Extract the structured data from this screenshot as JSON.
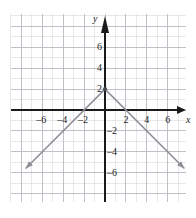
{
  "figure": {
    "background_color": "#ffffff",
    "plot_background_color": "#ffffff"
  },
  "chart_data": {
    "type": "line",
    "title": "",
    "xlabel": "x",
    "ylabel": "y",
    "xlim": [
      -8,
      8
    ],
    "ylim": [
      -7,
      7
    ],
    "grid": true,
    "grid_minor_spacing": 1,
    "grid_major_spacing": 2,
    "legend": "none",
    "equation": "y = -|x| + 2",
    "vertex": {
      "x": 0,
      "y": 2,
      "marker": "dot"
    },
    "xticks": [
      -6,
      -4,
      -2,
      2,
      4,
      6
    ],
    "xtick_labels": [
      "–6",
      "–4",
      "–2",
      "2",
      "4",
      "6"
    ],
    "yticks": [
      -6,
      -4,
      -2,
      2,
      4,
      6
    ],
    "ytick_labels": [
      "–6",
      "–4",
      "–2",
      "2",
      "4",
      "6"
    ],
    "series": [
      {
        "name": "y = -|x| + 2",
        "color": "#8d8d96",
        "arrow_start": true,
        "arrow_end": true,
        "x": [
          -7.6,
          0,
          7.6
        ],
        "y": [
          -5.6,
          2,
          -5.6
        ]
      }
    ],
    "colors": {
      "curve": "#8d8d96",
      "axis": "#1a1a1a",
      "grid_minor": "#dedee4",
      "grid_major": "#b9b9c2",
      "tick_text": "#1a1a1a"
    }
  }
}
